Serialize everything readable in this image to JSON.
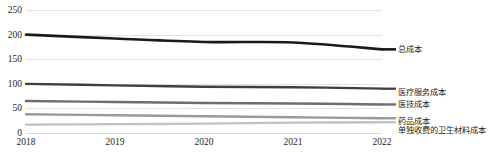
{
  "chart_data": {
    "type": "line",
    "title": "",
    "xlabel": "",
    "ylabel": "",
    "x": [
      "2018",
      "2019",
      "2020",
      "2021",
      "2022"
    ],
    "categories": [
      "2018",
      "2019",
      "2020",
      "2021",
      "2022"
    ],
    "ylim": [
      0,
      250
    ],
    "y_ticks": [
      0,
      50,
      100,
      150,
      200,
      250
    ],
    "grid": true,
    "legend_position": "right-inline",
    "series": [
      {
        "name": "总成本",
        "color": "#1a1a1a",
        "values": [
          200,
          192,
          185,
          184,
          170
        ]
      },
      {
        "name": "医疗服务成本",
        "color": "#3f3f3f",
        "values": [
          100,
          97,
          94,
          93,
          90
        ]
      },
      {
        "name": "医技成本",
        "color": "#6e6e6e",
        "values": [
          65,
          63,
          61,
          60,
          58
        ]
      },
      {
        "name": "药品成本",
        "color": "#9a9a9a",
        "values": [
          38,
          36,
          34,
          32,
          30
        ]
      },
      {
        "name": "单独收费的卫生材料成本",
        "color": "#c2c2c2",
        "values": [
          17,
          18,
          19,
          21,
          22
        ]
      }
    ]
  },
  "axis": {
    "y_ticks": [
      "250",
      "200",
      "150",
      "100",
      "50",
      "0"
    ],
    "x_ticks": [
      "2018",
      "2019",
      "2020",
      "2021",
      "2022"
    ]
  },
  "legend": {
    "items": [
      {
        "label": "总成本",
        "color": "#1a1a1a"
      },
      {
        "label": "医疗服务成本",
        "color": "#3f3f3f"
      },
      {
        "label": "医技成本",
        "color": "#6e6e6e"
      },
      {
        "label": "药品成本",
        "color": "#9a9a9a"
      },
      {
        "label": "单独收费的卫生材料成本",
        "color": "#c2c2c2"
      }
    ]
  }
}
